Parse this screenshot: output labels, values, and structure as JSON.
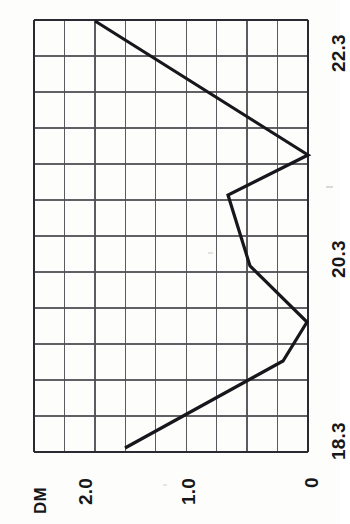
{
  "figure": {
    "kind": "rotated-line-chart",
    "orientation_note": "chart printed rotated 90 degrees (landscape plot on portrait page)",
    "background_color": "#fdfdfc",
    "ink_color": "#16171a",
    "grid_color": "#4a4c50",
    "frame_color": "#2a2c30"
  },
  "plot_box": {
    "left_px": 34,
    "top_px": 20,
    "right_px": 308,
    "bottom_px": 452,
    "columns": 9,
    "rows": 12
  },
  "axes": {
    "value_axis": {
      "name": "DM",
      "tick_labels": [
        "2.0",
        "1.0",
        "0"
      ],
      "tick_values": [
        2.0,
        1.0,
        0
      ],
      "tick_px": [
        103,
        205,
        308
      ],
      "min": 0,
      "max": 2.68,
      "px_per_unit": 102.5,
      "zero_px": 308
    },
    "date_axis": {
      "tick_labels": [
        "22.3",
        "20.3",
        "18.3"
      ],
      "tick_values": [
        22.3,
        20.3,
        18.3
      ],
      "tick_px": [
        38,
        245,
        452
      ],
      "start": 18.3,
      "end": 22.3,
      "px_per_unit": 51.75,
      "origin_px": 452
    }
  },
  "chart_data": {
    "type": "line",
    "title": "",
    "subtitle": "",
    "xlabel": "",
    "ylabel": "DM",
    "series_label": "DM",
    "orientation": "value axis horizontal (decreasing to the right), date axis vertical (increasing upward)",
    "x": [
      18.3,
      18.9,
      19.4,
      19.9,
      20.6,
      21.1,
      22.3
    ],
    "x_tick_labels": [
      "18.3",
      "20.3",
      "22.3"
    ],
    "y_tick_labels": [
      "2.0",
      "1.0",
      "0"
    ],
    "ylim": [
      0,
      2.68
    ],
    "xlim": [
      18.3,
      22.35
    ],
    "grid": true,
    "legend": "none",
    "values": [
      1.79,
      0.34,
      0.24,
      0.57,
      0.78,
      0.0,
      2.08
    ],
    "points_px": [
      {
        "value_px": 125,
        "date_px": 448
      },
      {
        "value_px": 283,
        "date_px": 361
      },
      {
        "value_px": 307,
        "date_px": 322
      },
      {
        "value_px": 250,
        "date_px": 266
      },
      {
        "value_px": 228,
        "date_px": 195
      },
      {
        "value_px": 308,
        "date_px": 155
      },
      {
        "value_px": 95,
        "date_px": 21
      }
    ],
    "annotations": []
  },
  "labels": {
    "series_name": "DM",
    "value_tick_2": "2.0",
    "value_tick_1": "1.0",
    "value_tick_0": "0",
    "date_tick_low": "18.3",
    "date_tick_mid": "20.3",
    "date_tick_high": "22.3"
  }
}
